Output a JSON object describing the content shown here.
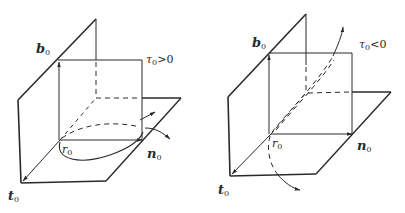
{
  "figure": {
    "colors": {
      "ink": "#2a2a2a",
      "background": "#ffffff"
    },
    "panels": [
      {
        "id": "left",
        "condition": "τ0>0",
        "labels": {
          "binormal": "b",
          "binormal_sub": "0",
          "tangent": "t",
          "tangent_sub": "0",
          "normal": "n",
          "normal_sub": "0",
          "point": "r",
          "point_sub": "0",
          "torsion": "τ",
          "torsion_sub": "0",
          "torsion_rel": ">0"
        }
      },
      {
        "id": "right",
        "condition": "τ0<0",
        "labels": {
          "binormal": "b",
          "binormal_sub": "0",
          "tangent": "t",
          "tangent_sub": "0",
          "normal": "n",
          "normal_sub": "0",
          "point": "r",
          "point_sub": "0",
          "torsion": "τ",
          "torsion_sub": "0",
          "torsion_rel": "<0"
        }
      }
    ]
  }
}
